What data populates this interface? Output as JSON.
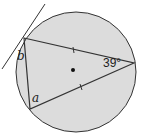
{
  "diagram": {
    "type": "circle-theorem",
    "colors": {
      "circle_fill": "#dcdcdc",
      "stroke": "#333333",
      "background": "#ffffff"
    },
    "labels": {
      "angle_given": "39°",
      "angle_a": "a",
      "angle_b": "b"
    },
    "markings": {
      "equal_sides": "two sides marked equal (tick marks) from the 39° vertex",
      "center_dot": true,
      "tangent_line": true
    }
  }
}
